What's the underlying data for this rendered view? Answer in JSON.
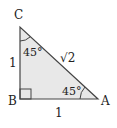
{
  "diagram": {
    "type": "right-isosceles-triangle",
    "vertices": {
      "C": {
        "label": "C"
      },
      "B": {
        "label": "B"
      },
      "A": {
        "label": "A"
      }
    },
    "sides": {
      "BC": "1",
      "AB": "1",
      "AC": "√2"
    },
    "angles": {
      "C": "45°",
      "A": "45°",
      "B": "right-angle"
    },
    "colors": {
      "fill": "#e8e8e8",
      "stroke": "#444444",
      "text": "#222222"
    }
  }
}
